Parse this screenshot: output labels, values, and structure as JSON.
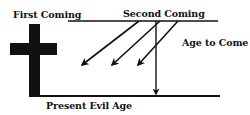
{
  "diagram": {
    "labels": {
      "first_coming": "First Coming",
      "second_coming": "Second Coming",
      "age_to_come": "Age to Come",
      "present_evil_age": "Present Evil Age"
    },
    "colors": {
      "ink": "#111111",
      "background": "#ffffff"
    },
    "elements": {
      "cross": "cross-icon",
      "top_line": "age-to-come-timeline",
      "bottom_line": "present-evil-age-timeline",
      "diagonal_arrows": 3,
      "vertical_arrow": 1
    }
  }
}
